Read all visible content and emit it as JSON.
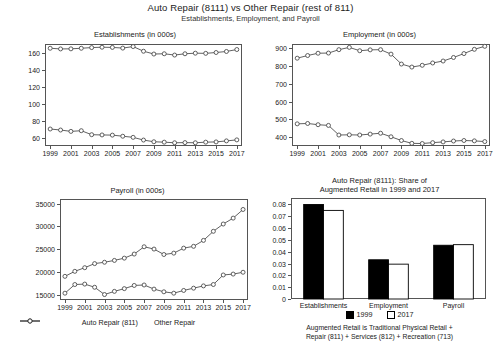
{
  "figure": {
    "title": "Auto Repair (8111) vs Other Repair (rest of 811)",
    "subtitle": "Establishments, Employment, and Payroll"
  },
  "series_legend": {
    "auto_label": "Auto Repair (811)",
    "other_label": "Other Repair"
  },
  "bar_legend": {
    "y1999": "1999",
    "y2017": "2017"
  },
  "footnote": {
    "line1": "Augmented Retail is Traditional Physical Retail +",
    "line2": "Repair (811) + Services (812) + Recreation (713)"
  },
  "chart_data": [
    {
      "id": "establishments",
      "type": "line",
      "title": "Establishments (in 000s)",
      "xlabel": "",
      "ylabel": "",
      "grid": false,
      "legend": "below-payroll",
      "x": [
        1999,
        2000,
        2001,
        2002,
        2003,
        2004,
        2005,
        2006,
        2007,
        2008,
        2009,
        2010,
        2011,
        2012,
        2013,
        2014,
        2015,
        2016,
        2017
      ],
      "xticks": [
        1999,
        2001,
        2003,
        2005,
        2007,
        2009,
        2011,
        2013,
        2015,
        2017
      ],
      "yticks": [
        60,
        80,
        100,
        120,
        140,
        160
      ],
      "ylim": [
        50,
        170
      ],
      "xlim": [
        1998.5,
        2017.5
      ],
      "series": [
        {
          "name": "Auto Repair (811)",
          "values": [
            165.0,
            164.2,
            164.3,
            165.0,
            165.8,
            166.2,
            166.0,
            165.2,
            167.0,
            161.5,
            158.2,
            158.5,
            157.0,
            158.5,
            159.2,
            159.0,
            160.0,
            161.2,
            163.5
          ]
        },
        {
          "name": "Other Repair",
          "values": [
            70.0,
            68.8,
            67.2,
            68.0,
            63.3,
            63.0,
            62.8,
            61.5,
            60.2,
            57.0,
            55.0,
            54.5,
            53.8,
            54.0,
            53.8,
            54.5,
            54.8,
            56.0,
            57.2
          ]
        }
      ]
    },
    {
      "id": "employment",
      "type": "line",
      "title": "Employment (in 000s)",
      "xlabel": "",
      "ylabel": "",
      "grid": false,
      "x": [
        1999,
        2000,
        2001,
        2002,
        2003,
        2004,
        2005,
        2006,
        2007,
        2008,
        2009,
        2010,
        2011,
        2012,
        2013,
        2014,
        2015,
        2016,
        2017
      ],
      "xticks": [
        1999,
        2001,
        2003,
        2005,
        2007,
        2009,
        2011,
        2013,
        2015,
        2017
      ],
      "yticks": [
        400,
        500,
        600,
        700,
        800,
        900
      ],
      "ylim": [
        350,
        925
      ],
      "xlim": [
        1998.5,
        2017.5
      ],
      "series": [
        {
          "name": "Auto Repair (811)",
          "values": [
            845,
            860,
            873,
            874,
            893,
            906,
            887,
            892,
            893,
            868,
            812,
            795,
            805,
            818,
            829,
            849,
            871,
            895,
            912
          ]
        },
        {
          "name": "Other Repair",
          "values": [
            475,
            477,
            470,
            466,
            412,
            413,
            412,
            417,
            422,
            402,
            381,
            365,
            364,
            369,
            373,
            378,
            381,
            379,
            375
          ]
        }
      ]
    },
    {
      "id": "payroll",
      "type": "line",
      "title": "Payroll (in 000s)",
      "xlabel": "",
      "ylabel": "",
      "grid": false,
      "x": [
        1999,
        2000,
        2001,
        2002,
        2003,
        2004,
        2005,
        2006,
        2007,
        2008,
        2009,
        2010,
        2011,
        2012,
        2013,
        2014,
        2015,
        2016,
        2017
      ],
      "xticks": [
        1999,
        2001,
        2003,
        2005,
        2007,
        2009,
        2011,
        2013,
        2015,
        2017
      ],
      "yticks": [
        15000,
        20000,
        25000,
        30000,
        35000
      ],
      "ylim": [
        13800,
        36000
      ],
      "xlim": [
        1998.5,
        2017.5
      ],
      "series": [
        {
          "name": "Auto Repair (811)",
          "values": [
            19000,
            20100,
            20900,
            21800,
            22100,
            22500,
            23000,
            23900,
            25500,
            25000,
            23800,
            24100,
            25200,
            25600,
            26900,
            28900,
            30500,
            31800,
            33700
          ]
        },
        {
          "name": "Other Repair",
          "values": [
            15300,
            17200,
            17300,
            16600,
            15000,
            15700,
            16300,
            17000,
            17100,
            16200,
            15600,
            15300,
            15900,
            16400,
            16900,
            17200,
            19300,
            19500,
            19900
          ]
        }
      ]
    },
    {
      "id": "share",
      "type": "bar",
      "title_line1": "Auto Repair (8111): Share of",
      "title_line2": "Augmented Retail in 1999 and 2017",
      "categories": [
        "Establishments",
        "Employment",
        "Payroll"
      ],
      "yticks": [
        0,
        0.01,
        0.02,
        0.03,
        0.04,
        0.05,
        0.06,
        0.07,
        0.08
      ],
      "ytick_labels": [
        "0",
        "0.01",
        "0.02",
        "0.03",
        "0.04",
        "0.05",
        "0.06",
        "0.07",
        "0.08"
      ],
      "ylim": [
        0,
        0.0855
      ],
      "series": [
        {
          "name": "1999",
          "color": "#000000",
          "values": [
            0.08,
            0.0332,
            0.0455
          ]
        },
        {
          "name": "2017",
          "color": "#ffffff",
          "values": [
            0.075,
            0.0295,
            0.046
          ]
        }
      ]
    }
  ]
}
